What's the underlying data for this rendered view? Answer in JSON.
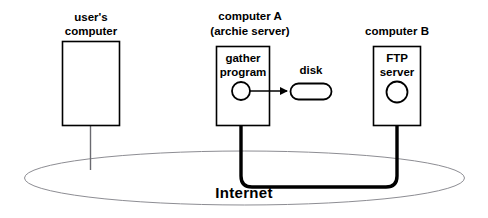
{
  "diagram": {
    "title_text": "Internet",
    "nodes": [
      {
        "id": "users-computer",
        "label_line1": "user's",
        "label_line2": "computer",
        "inner_label": ""
      },
      {
        "id": "computer-a",
        "label_line1": "computer A",
        "label_line2": "(archie server)",
        "inner_label_line1": "gather",
        "inner_label_line2": "program"
      },
      {
        "id": "computer-b",
        "label_line1": "computer B",
        "label_line2": "",
        "inner_label_line1": "FTP",
        "inner_label_line2": "server"
      }
    ],
    "storage": {
      "label": "disk"
    },
    "cloud": {
      "label": "Internet"
    },
    "colors": {
      "stroke": "#000000",
      "cloud_stroke": "#8d8d93",
      "thin_link": "#6a6a70",
      "background": "#ffffff"
    }
  }
}
